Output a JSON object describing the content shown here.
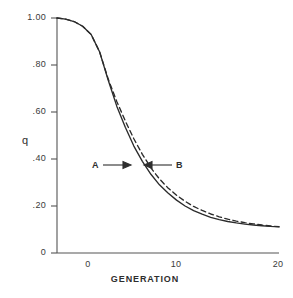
{
  "chart_data": {
    "type": "line",
    "title": "",
    "subtitle": "",
    "xlabel": "GENERATION",
    "ylabel": "q",
    "xlim": [
      -6,
      20
    ],
    "ylim": [
      0,
      1.0
    ],
    "grid": false,
    "legend_position": "inline-annotations",
    "xticks": [
      "0",
      "10",
      "20"
    ],
    "xtick_values": [
      0,
      10,
      20
    ],
    "yticks": [
      "1.00",
      ".80",
      ".60",
      ".40",
      ".20",
      "0"
    ],
    "ytick_values": [
      1.0,
      0.8,
      0.6,
      0.4,
      0.2,
      0.0
    ],
    "annotations": [
      {
        "text": "A",
        "target_x": 3.1,
        "target_y": 0.4,
        "arrow": "right"
      },
      {
        "text": "B",
        "target_x": 4.9,
        "target_y": 0.4,
        "arrow": "left"
      }
    ],
    "series": [
      {
        "name": "A",
        "style": "solid",
        "color": "#2b2b2b",
        "x": [
          -6,
          -5,
          -4,
          -3,
          -2,
          -1,
          0,
          1,
          2,
          3,
          4,
          5,
          6,
          7,
          8,
          9,
          10,
          11,
          12,
          13,
          14,
          15,
          16,
          17,
          18,
          19,
          20
        ],
        "values": [
          1.0,
          0.995,
          0.985,
          0.965,
          0.93,
          0.855,
          0.735,
          0.625,
          0.535,
          0.455,
          0.39,
          0.335,
          0.29,
          0.255,
          0.225,
          0.2,
          0.18,
          0.165,
          0.152,
          0.142,
          0.134,
          0.128,
          0.123,
          0.119,
          0.116,
          0.113,
          0.111
        ]
      },
      {
        "name": "B",
        "style": "dashed",
        "color": "#2b2b2b",
        "x": [
          -6,
          -5,
          -4,
          -3,
          -2,
          -1,
          0,
          1,
          2,
          3,
          4,
          5,
          6,
          7,
          8,
          9,
          10,
          11,
          12,
          13,
          14,
          15,
          16,
          17,
          18,
          19,
          20
        ],
        "values": [
          1.0,
          0.995,
          0.985,
          0.965,
          0.93,
          0.855,
          0.74,
          0.645,
          0.562,
          0.486,
          0.42,
          0.362,
          0.315,
          0.277,
          0.246,
          0.22,
          0.198,
          0.181,
          0.166,
          0.154,
          0.144,
          0.136,
          0.129,
          0.124,
          0.119,
          0.115,
          0.112
        ]
      }
    ]
  },
  "figure": {
    "background_color": "#ffffff",
    "axis_color": "#555555",
    "line_color": "#2b2b2b"
  }
}
